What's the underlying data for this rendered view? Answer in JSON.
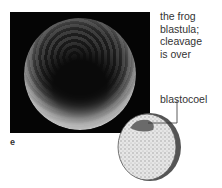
{
  "figure": {
    "caption": "the frog blastula; cleavage is over",
    "caption_lines": [
      "the frog",
      "blastula;",
      "cleavage",
      "is over"
    ],
    "panel_letter": "e",
    "labels": {
      "blastocoel": "blastocoel"
    }
  }
}
